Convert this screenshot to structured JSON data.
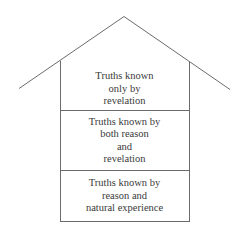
{
  "diagram": {
    "type": "house-of-knowledge",
    "line_color": "#6b6b6b",
    "roof": {
      "peak": [
        124,
        16
      ],
      "left_end": [
        19,
        88
      ],
      "right_end": [
        230,
        89
      ]
    },
    "compartments": [
      {
        "id": "top",
        "lines": [
          "Truths known",
          "only by",
          "revelation"
        ]
      },
      {
        "id": "middle",
        "lines": [
          "Truths known by",
          "both reason",
          "and",
          "revelation"
        ]
      },
      {
        "id": "bottom",
        "lines": [
          "Truths known by",
          "reason and",
          "natural experience"
        ]
      }
    ]
  }
}
